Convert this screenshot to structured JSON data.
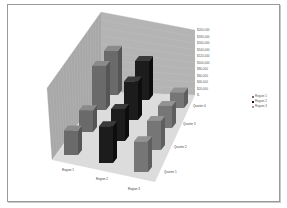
{
  "chart_data": {
    "type": "bar",
    "subtype": "3d-column",
    "title": "",
    "categories": [
      "Region 1",
      "Region 2",
      "Region 3"
    ],
    "depth_categories": [
      "Quarter 1",
      "Quarter 2",
      "Quarter 3",
      "Quarter 4"
    ],
    "series": [
      {
        "name": "Quarter 1",
        "values": [
          80000,
          120000,
          100000
        ]
      },
      {
        "name": "Quarter 2",
        "values": [
          75000,
          110000,
          100000
        ]
      },
      {
        "name": "Quarter 3",
        "values": [
          160000,
          140000,
          80000
        ]
      },
      {
        "name": "Quarter 4",
        "values": [
          170000,
          150000,
          60000
        ]
      }
    ],
    "xlabel": "",
    "ylabel": "",
    "ylim": [
      0,
      200000
    ],
    "y_ticks": [
      "$200,000",
      "$180,000",
      "$160,000",
      "$140,000",
      "$120,000",
      "$100,000",
      "$80,000",
      "$60,000",
      "$40,000",
      "$20,000",
      "$-"
    ],
    "grid": true,
    "legend": {
      "position": "right",
      "entries": [
        "Region 1",
        "Region 2",
        "Region 3"
      ]
    },
    "colors": {
      "Region 1": "#6e6e6e",
      "Region 2": "#1a1a1a",
      "Region 3": "#7a7a7a",
      "wall": "#9a9a9a",
      "floor": "#d8d8d8"
    }
  }
}
